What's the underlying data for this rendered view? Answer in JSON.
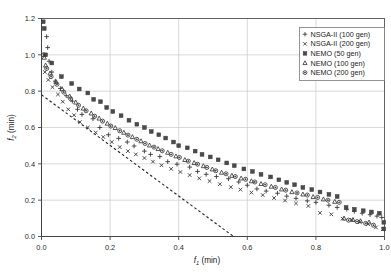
{
  "chart_data": {
    "type": "scatter",
    "title": "",
    "xlabel": "f1 (min)",
    "ylabel": "f2 (min)",
    "xlabel_base": "f",
    "xlabel_sub": "1",
    "xlabel_unit": " (min)",
    "ylabel_base": "f",
    "ylabel_sub": "2",
    "ylabel_unit": " (min)",
    "xlim": [
      0.0,
      1.0
    ],
    "ylim": [
      0.0,
      1.2
    ],
    "xticks": [
      0.0,
      0.2,
      0.4,
      0.6,
      0.8,
      1.0
    ],
    "yticks": [
      0.0,
      0.2,
      0.4,
      0.6,
      0.8,
      1.0,
      1.2
    ],
    "xticklabels": [
      "0.0",
      "0.2",
      "0.4",
      "0.6",
      "0.8",
      "1.0"
    ],
    "yticklabels": [
      "0.0",
      "0.2",
      "0.4",
      "0.6",
      "0.8",
      "1.0",
      "1.2"
    ],
    "grid": true,
    "grid_color": "#c8c8c8",
    "legend_position": "top-right",
    "reference_line": {
      "name": "linear-reference-line",
      "style": "dashed",
      "color": "#222222",
      "points": [
        [
          0.0,
          0.78
        ],
        [
          0.56,
          0.0
        ]
      ]
    },
    "series": [
      {
        "name": "NSGA-II (100 gen)",
        "marker": "plus",
        "color": "#3a3a3a",
        "points": [
          [
            0.015,
            1.1
          ],
          [
            0.018,
            1.04
          ],
          [
            0.022,
            0.965
          ],
          [
            0.03,
            0.905
          ],
          [
            0.04,
            0.855
          ],
          [
            0.055,
            0.815
          ],
          [
            0.072,
            0.775
          ],
          [
            0.09,
            0.745
          ],
          [
            0.105,
            0.7
          ],
          [
            0.118,
            0.672
          ],
          [
            0.15,
            0.648
          ],
          [
            0.17,
            0.6
          ],
          [
            0.195,
            0.56
          ],
          [
            0.225,
            0.54
          ],
          [
            0.25,
            0.52
          ],
          [
            0.27,
            0.498
          ],
          [
            0.3,
            0.47
          ],
          [
            0.318,
            0.452
          ],
          [
            0.345,
            0.44
          ],
          [
            0.368,
            0.412
          ],
          [
            0.395,
            0.398
          ],
          [
            0.432,
            0.382
          ],
          [
            0.455,
            0.358
          ],
          [
            0.48,
            0.342
          ],
          [
            0.51,
            0.33
          ],
          [
            0.545,
            0.318
          ],
          [
            0.575,
            0.3
          ],
          [
            0.6,
            0.282
          ],
          [
            0.628,
            0.262
          ],
          [
            0.655,
            0.25
          ],
          [
            0.688,
            0.238
          ],
          [
            0.715,
            0.222
          ],
          [
            0.742,
            0.21
          ],
          [
            0.775,
            0.196
          ],
          [
            0.8,
            0.188
          ],
          [
            0.838,
            0.172
          ],
          [
            0.862,
            0.16
          ],
          [
            0.89,
            0.15
          ],
          [
            0.912,
            0.138
          ],
          [
            0.935,
            0.128
          ],
          [
            0.958,
            0.12
          ],
          [
            0.978,
            0.112
          ],
          [
            0.992,
            0.105
          ]
        ]
      },
      {
        "name": "NSGA-II (200 gen)",
        "marker": "cross",
        "color": "#3a3a3a",
        "points": [
          [
            0.01,
            0.905
          ],
          [
            0.02,
            0.862
          ],
          [
            0.032,
            0.822
          ],
          [
            0.048,
            0.782
          ],
          [
            0.062,
            0.742
          ],
          [
            0.078,
            0.7
          ],
          [
            0.095,
            0.668
          ],
          [
            0.112,
            0.63
          ],
          [
            0.135,
            0.6
          ],
          [
            0.158,
            0.572
          ],
          [
            0.18,
            0.548
          ],
          [
            0.205,
            0.52
          ],
          [
            0.228,
            0.492
          ],
          [
            0.252,
            0.47
          ],
          [
            0.275,
            0.452
          ],
          [
            0.3,
            0.432
          ],
          [
            0.325,
            0.412
          ],
          [
            0.35,
            0.392
          ],
          [
            0.378,
            0.372
          ],
          [
            0.405,
            0.355
          ],
          [
            0.432,
            0.338
          ],
          [
            0.46,
            0.32
          ],
          [
            0.49,
            0.305
          ],
          [
            0.52,
            0.288
          ],
          [
            0.552,
            0.272
          ],
          [
            0.58,
            0.258
          ],
          [
            0.612,
            0.242
          ],
          [
            0.645,
            0.228
          ],
          [
            0.678,
            0.212
          ],
          [
            0.71,
            0.198
          ],
          [
            0.742,
            0.182
          ],
          [
            0.778,
            0.168
          ],
          [
            0.812,
            0.13
          ],
          [
            0.845,
            0.122
          ],
          [
            0.878,
            0.098
          ],
          [
            0.905,
            0.092
          ],
          [
            0.928,
            0.08
          ],
          [
            0.952,
            0.068
          ],
          [
            0.975,
            0.05
          ],
          [
            0.995,
            0.04
          ]
        ]
      },
      {
        "name": "NEMO (50 gen)",
        "marker": "square",
        "color": "#3a3a3a",
        "points": [
          [
            0.005,
            1.182
          ],
          [
            0.008,
            1.145
          ],
          [
            0.012,
            1.0
          ],
          [
            0.03,
            0.955
          ],
          [
            0.058,
            0.88
          ],
          [
            0.088,
            0.842
          ],
          [
            0.11,
            0.812
          ],
          [
            0.135,
            0.79
          ],
          [
            0.152,
            0.755
          ],
          [
            0.172,
            0.742
          ],
          [
            0.19,
            0.71
          ],
          [
            0.208,
            0.688
          ],
          [
            0.232,
            0.665
          ],
          [
            0.255,
            0.64
          ],
          [
            0.278,
            0.618
          ],
          [
            0.3,
            0.6
          ],
          [
            0.32,
            0.578
          ],
          [
            0.342,
            0.56
          ],
          [
            0.362,
            0.542
          ],
          [
            0.385,
            0.52
          ],
          [
            0.4,
            0.5
          ],
          [
            0.425,
            0.488
          ],
          [
            0.448,
            0.47
          ],
          [
            0.468,
            0.452
          ],
          [
            0.492,
            0.438
          ],
          [
            0.515,
            0.422
          ],
          [
            0.54,
            0.405
          ],
          [
            0.562,
            0.39
          ],
          [
            0.59,
            0.372
          ],
          [
            0.615,
            0.358
          ],
          [
            0.64,
            0.342
          ],
          [
            0.668,
            0.328
          ],
          [
            0.692,
            0.312
          ],
          [
            0.715,
            0.298
          ],
          [
            0.738,
            0.285
          ],
          [
            0.762,
            0.27
          ],
          [
            0.788,
            0.258
          ],
          [
            0.812,
            0.245
          ],
          [
            0.838,
            0.232
          ],
          [
            0.862,
            0.22
          ],
          [
            0.888,
            0.16
          ],
          [
            0.912,
            0.15
          ],
          [
            0.938,
            0.142
          ],
          [
            0.962,
            0.135
          ],
          [
            0.985,
            0.128
          ],
          [
            0.998,
            0.078
          ],
          [
            0.998,
            0.042
          ]
        ]
      },
      {
        "name": "NEMO (100 gen)",
        "marker": "triangle",
        "color": "#3a3a3a",
        "points": [
          [
            0.008,
            0.985
          ],
          [
            0.012,
            0.942
          ],
          [
            0.025,
            0.898
          ],
          [
            0.042,
            0.852
          ],
          [
            0.06,
            0.812
          ],
          [
            0.082,
            0.772
          ],
          [
            0.1,
            0.738
          ],
          [
            0.122,
            0.705
          ],
          [
            0.145,
            0.678
          ],
          [
            0.168,
            0.65
          ],
          [
            0.192,
            0.622
          ],
          [
            0.215,
            0.598
          ],
          [
            0.24,
            0.572
          ],
          [
            0.265,
            0.548
          ],
          [
            0.29,
            0.525
          ],
          [
            0.315,
            0.502
          ],
          [
            0.34,
            0.482
          ],
          [
            0.368,
            0.462
          ],
          [
            0.392,
            0.442
          ],
          [
            0.418,
            0.422
          ],
          [
            0.445,
            0.405
          ],
          [
            0.472,
            0.388
          ],
          [
            0.498,
            0.37
          ],
          [
            0.525,
            0.352
          ],
          [
            0.555,
            0.335
          ],
          [
            0.582,
            0.32
          ],
          [
            0.612,
            0.305
          ],
          [
            0.64,
            0.29
          ],
          [
            0.67,
            0.275
          ],
          [
            0.7,
            0.26
          ],
          [
            0.73,
            0.245
          ],
          [
            0.762,
            0.232
          ],
          [
            0.792,
            0.218
          ],
          [
            0.822,
            0.205
          ],
          [
            0.855,
            0.192
          ],
          [
            0.882,
            0.1
          ],
          [
            0.908,
            0.092
          ],
          [
            0.93,
            0.085
          ],
          [
            0.955,
            0.078
          ]
        ]
      },
      {
        "name": "NEMO (200 gen)",
        "marker": "circle",
        "color": "#3a3a3a",
        "points": [
          [
            0.006,
            1.0
          ],
          [
            0.015,
            0.925
          ],
          [
            0.028,
            0.88
          ],
          [
            0.045,
            0.838
          ],
          [
            0.065,
            0.795
          ],
          [
            0.085,
            0.758
          ],
          [
            0.108,
            0.722
          ],
          [
            0.13,
            0.692
          ],
          [
            0.155,
            0.662
          ],
          [
            0.178,
            0.635
          ],
          [
            0.202,
            0.608
          ],
          [
            0.228,
            0.582
          ],
          [
            0.252,
            0.558
          ],
          [
            0.278,
            0.535
          ],
          [
            0.302,
            0.512
          ],
          [
            0.328,
            0.492
          ],
          [
            0.352,
            0.472
          ],
          [
            0.378,
            0.452
          ],
          [
            0.402,
            0.435
          ],
          [
            0.428,
            0.415
          ],
          [
            0.455,
            0.398
          ],
          [
            0.482,
            0.38
          ],
          [
            0.508,
            0.362
          ],
          [
            0.538,
            0.345
          ],
          [
            0.565,
            0.33
          ],
          [
            0.595,
            0.315
          ],
          [
            0.622,
            0.3
          ],
          [
            0.652,
            0.285
          ],
          [
            0.682,
            0.27
          ],
          [
            0.712,
            0.255
          ],
          [
            0.745,
            0.24
          ],
          [
            0.775,
            0.228
          ],
          [
            0.805,
            0.215
          ],
          [
            0.835,
            0.2
          ],
          [
            0.868,
            0.188
          ],
          [
            0.895,
            0.09
          ],
          [
            0.92,
            0.082
          ],
          [
            0.945,
            0.072
          ],
          [
            0.968,
            0.062
          ]
        ]
      }
    ]
  },
  "legend": {
    "items": [
      {
        "label": "NSGA-II (100 gen)",
        "marker": "plus"
      },
      {
        "label": "NSGA-II (200 gen)",
        "marker": "cross"
      },
      {
        "label": "NEMO (50 gen)",
        "marker": "square"
      },
      {
        "label": "NEMO (100 gen)",
        "marker": "triangle"
      },
      {
        "label": "NEMO (200 gen)",
        "marker": "circle"
      }
    ]
  }
}
